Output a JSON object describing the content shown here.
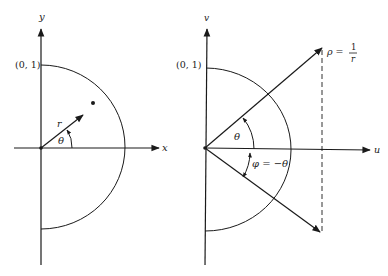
{
  "figure": {
    "left_panel": {
      "x_axis_label": "x",
      "y_axis_label": "y",
      "unit_point_label": "(0, 1)",
      "radius_label": "r",
      "angle_label": "θ"
    },
    "right_panel": {
      "u_axis_label": "u",
      "v_axis_label": "v",
      "unit_point_label": "(0, 1)",
      "rho_label_lhs": "ρ =",
      "rho_label_num": "1",
      "rho_label_den": "r",
      "angle_label": "θ",
      "phi_label": "φ = −θ"
    }
  },
  "colors": {
    "ink": "#1a1a1a",
    "background": "#ffffff"
  }
}
